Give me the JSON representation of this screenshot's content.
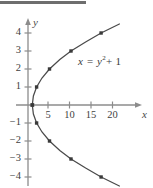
{
  "figure": {
    "top_rule_color": "#6e6e6e",
    "background_color": "#ffffff",
    "axis_color": "#8c8c8c",
    "curve_color": "#4a4a4a",
    "point_color": "#3a3a3a",
    "equation_text": "x = y",
    "equation_exponent": "2",
    "equation_tail": "+ 1",
    "x_axis_label": "x",
    "y_axis_label": "y"
  },
  "chart_data": {
    "type": "line",
    "title": "",
    "subtitle": "",
    "xlabel": "x",
    "ylabel": "y",
    "annotation": "x = y² + 1",
    "grid": false,
    "legend": "none",
    "xlim": [
      -2,
      26
    ],
    "ylim": [
      -5,
      5
    ],
    "x_ticks": [
      5,
      10,
      15,
      20
    ],
    "x_tick_labels": [
      "5",
      "10",
      "15",
      "20"
    ],
    "y_ticks": [
      4,
      3,
      2,
      1,
      -1,
      -2,
      -3,
      -4
    ],
    "y_tick_labels": [
      "4",
      "3",
      "2",
      "1",
      "−1",
      "−2",
      "−3",
      "−4"
    ],
    "equation": "x = y^2 + 1",
    "marked_points": [
      {
        "x": 17,
        "y": 4
      },
      {
        "x": 10,
        "y": 3
      },
      {
        "x": 5,
        "y": 2
      },
      {
        "x": 2,
        "y": 1
      },
      {
        "x": 1,
        "y": 0
      },
      {
        "x": 2,
        "y": -1
      },
      {
        "x": 5,
        "y": -2
      },
      {
        "x": 10,
        "y": -3
      },
      {
        "x": 17,
        "y": -4
      }
    ],
    "series": [
      {
        "name": "x = y^2 + 1",
        "x": [
          21.25,
          17.0,
          13.4,
          10.0,
          7.4,
          5.0,
          3.25,
          2.0,
          1.25,
          1.0,
          1.25,
          2.0,
          3.25,
          5.0,
          7.4,
          10.0,
          13.4,
          17.0,
          21.25
        ],
        "y": [
          4.5,
          4.0,
          3.5,
          3.0,
          2.53,
          2.0,
          1.5,
          1.0,
          0.5,
          0.0,
          -0.5,
          -1.0,
          -1.5,
          -2.0,
          -2.53,
          -3.0,
          -3.5,
          -4.0,
          -4.5
        ]
      }
    ]
  },
  "tick_positions": {
    "x": [
      {
        "label": "5",
        "px": 48
      },
      {
        "label": "10",
        "px": 69.5
      },
      {
        "label": "15",
        "px": 91
      },
      {
        "label": "20",
        "px": 112.5
      }
    ],
    "y": [
      {
        "label": "4",
        "py": 33
      },
      {
        "label": "3",
        "py": 51
      },
      {
        "label": "2",
        "py": 69
      },
      {
        "label": "1",
        "py": 87
      },
      {
        "label": "−1",
        "py": 123
      },
      {
        "label": "−2",
        "py": 141
      },
      {
        "label": "−3",
        "py": 159
      },
      {
        "label": "−4",
        "py": 177
      }
    ]
  }
}
